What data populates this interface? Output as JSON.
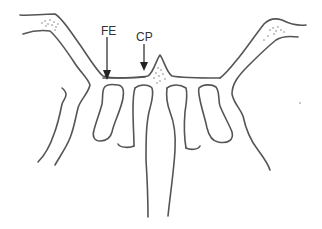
{
  "diagram": {
    "type": "anatomical line drawing (cross-section)",
    "labels": [
      {
        "id": "FE",
        "text": "FE",
        "x": 101,
        "y": 25
      },
      {
        "id": "CP",
        "text": "CP",
        "x": 138,
        "y": 31
      }
    ],
    "colors": {
      "background": "#ffffff",
      "stroke": "#555555",
      "arrow": "#222222"
    }
  }
}
